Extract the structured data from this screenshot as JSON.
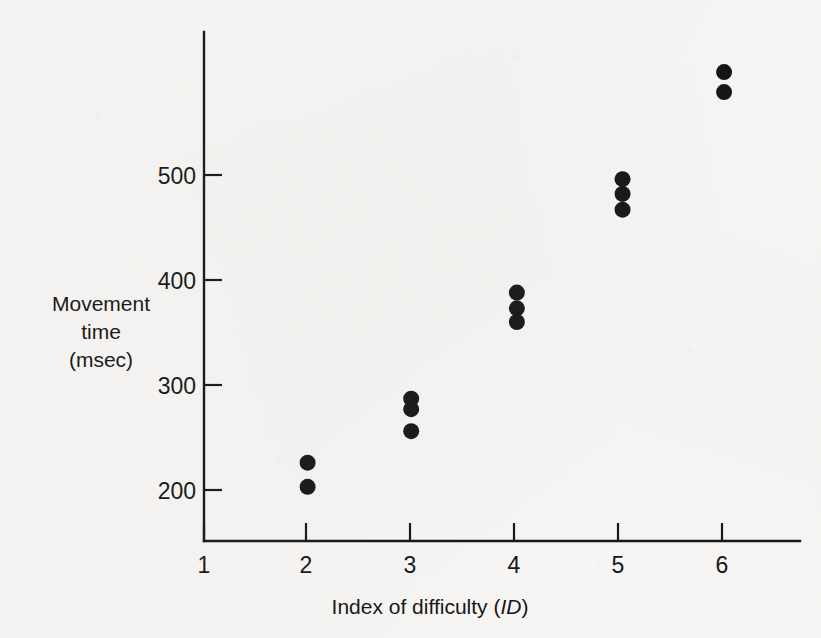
{
  "figure": {
    "background_color": "#f6f5f3",
    "ink_color": "#141414"
  },
  "chart_data": {
    "type": "scatter",
    "title": "",
    "xlabel": "Index of difficulty (ID)",
    "xlabel_plain": "Index of difficulty",
    "xlabel_italic_part": "ID",
    "ylabel": "Movement time (msec)",
    "ylabel_lines": [
      "Movement",
      "time",
      "(msec)"
    ],
    "xlim": [
      1,
      6.6
    ],
    "ylim": [
      150,
      620
    ],
    "xticks": [
      1,
      2,
      3,
      4,
      5,
      6
    ],
    "xtick_labels": [
      "1",
      "2",
      "3",
      "4",
      "5",
      "6"
    ],
    "yticks": [
      200,
      300,
      400,
      500
    ],
    "ytick_labels": [
      "200",
      "300",
      "400",
      "500"
    ],
    "grid": false,
    "legend": "none",
    "marker": "filled-circle",
    "x": [
      2,
      2,
      3,
      3,
      3,
      4,
      4,
      4,
      5,
      5,
      5,
      6,
      6
    ],
    "y": [
      226,
      203,
      287,
      277,
      256,
      388,
      373,
      360,
      496,
      482,
      467,
      598,
      579
    ],
    "points": [
      {
        "x": 2,
        "y": 226
      },
      {
        "x": 2,
        "y": 203
      },
      {
        "x": 3,
        "y": 287
      },
      {
        "x": 3,
        "y": 277
      },
      {
        "x": 3,
        "y": 256
      },
      {
        "x": 4.02,
        "y": 388
      },
      {
        "x": 4.02,
        "y": 373
      },
      {
        "x": 4.02,
        "y": 360
      },
      {
        "x": 5.04,
        "y": 496
      },
      {
        "x": 5.04,
        "y": 482
      },
      {
        "x": 5.04,
        "y": 467
      },
      {
        "x": 6.02,
        "y": 598
      },
      {
        "x": 6.02,
        "y": 579
      }
    ]
  }
}
